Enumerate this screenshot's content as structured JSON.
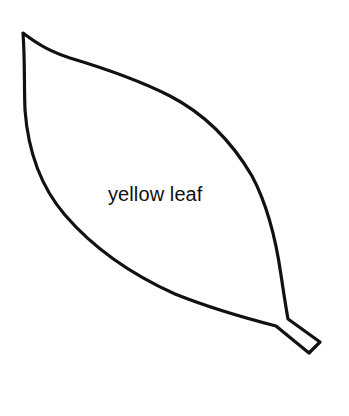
{
  "diagram": {
    "type": "outline-shape",
    "shape": "leaf",
    "label": "yellow leaf",
    "colors": {
      "background": "#ffffff",
      "stroke": "#111111",
      "fill": "#ffffff",
      "text": "#111111"
    },
    "stroke_width": 3.2
  }
}
